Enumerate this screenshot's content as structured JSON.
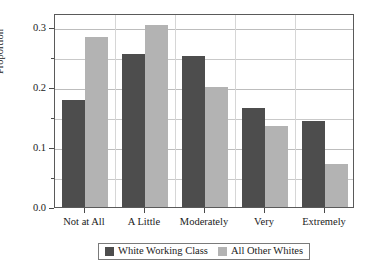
{
  "chart_data": {
    "type": "bar",
    "title": "",
    "subtitle": "",
    "xlabel": "",
    "ylabel": "Proportion",
    "categories": [
      "Not at All",
      "A Little",
      "Moderately",
      "Very",
      "Extremely"
    ],
    "series": [
      {
        "name": "White Working Class",
        "color": "#4d4d4d",
        "values": [
          0.178,
          0.255,
          0.252,
          0.165,
          0.143
        ]
      },
      {
        "name": "All Other Whites",
        "color": "#b3b3b3",
        "values": [
          0.283,
          0.303,
          0.2,
          0.135,
          0.072
        ]
      }
    ],
    "ylim": [
      0.0,
      0.323
    ],
    "yticks": [
      0.0,
      0.1,
      0.2,
      0.3
    ],
    "ytick_labels": [
      "0.0",
      "0.1",
      "0.2",
      "0.3"
    ],
    "yticks_minor": [
      0.05,
      0.15,
      0.25
    ],
    "grid": true,
    "grid_axis": "both",
    "legend_position": "bottom-center",
    "legend_entries": [
      "White Working Class",
      "All Other Whites"
    ],
    "background": "#ffffff",
    "frame_color": "#5a5a5a"
  }
}
